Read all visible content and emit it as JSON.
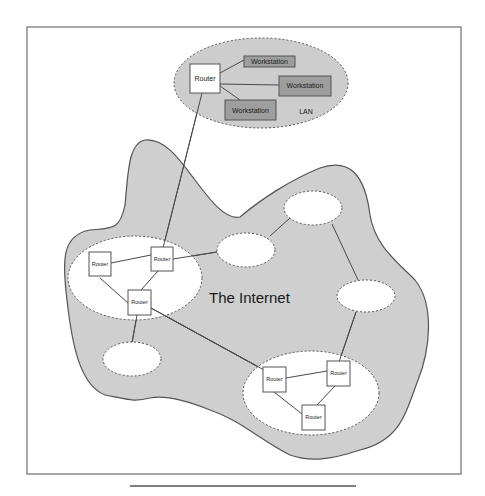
{
  "diagram": {
    "title": "The Internet",
    "lan_label": "LAN",
    "colors": {
      "cloud_fill": "#cfcfcf",
      "lan_fill": "#cdcdcd",
      "workstation_fill": "#9e9e9e",
      "subnet_fill": "#ffffff",
      "stroke": "#4a4a4a",
      "frame": "#8a8a8a"
    },
    "lan": {
      "router": {
        "label": "Router"
      },
      "workstations": [
        {
          "label": "Workstation"
        },
        {
          "label": "Workstation"
        },
        {
          "label": "Workstation"
        }
      ]
    },
    "subnets": [
      {
        "name": "left-subnet",
        "routers": [
          {
            "label": "Router"
          },
          {
            "label": "Router"
          },
          {
            "label": "Router"
          }
        ]
      },
      {
        "name": "bottom-right-subnet",
        "routers": [
          {
            "label": "Router"
          },
          {
            "label": "Router"
          },
          {
            "label": "Router"
          }
        ]
      }
    ],
    "empty_networks": 4
  }
}
